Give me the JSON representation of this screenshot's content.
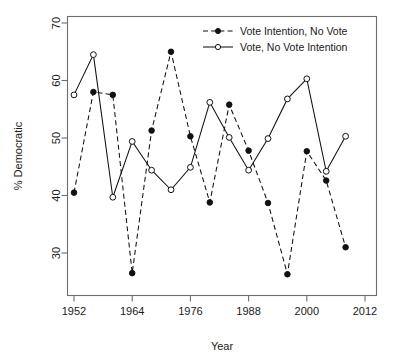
{
  "chart_data": {
    "type": "line",
    "title": "",
    "xlabel": "Year",
    "ylabel": "% Democratic",
    "xlim": [
      1950,
      2013
    ],
    "ylim": [
      25,
      71
    ],
    "xticks": [
      1952,
      1964,
      1976,
      1988,
      2000,
      2012
    ],
    "yticks": [
      30,
      40,
      50,
      60,
      70
    ],
    "grid": false,
    "legend_position": "top-right",
    "x": [
      1952,
      1956,
      1960,
      1964,
      1968,
      1972,
      1976,
      1980,
      1984,
      1988,
      1992,
      1996,
      2000,
      2004,
      2008
    ],
    "series": [
      {
        "name": "Vote Intention, No Vote",
        "marker": "filled-circle",
        "line": "dashed",
        "color": "#111111",
        "values": [
          40.5,
          58.0,
          57.5,
          26.5,
          51.3,
          65.0,
          50.3,
          38.8,
          55.8,
          47.8,
          38.7,
          26.3,
          47.7,
          42.6,
          31.0
        ]
      },
      {
        "name": "Vote, No Vote Intention",
        "marker": "open-circle",
        "line": "solid",
        "color": "#111111",
        "values": [
          57.5,
          64.5,
          39.7,
          49.4,
          44.4,
          41.0,
          44.9,
          56.2,
          50.1,
          44.4,
          49.9,
          56.8,
          60.3,
          44.2,
          50.3
        ]
      }
    ]
  },
  "legend": {
    "entries": [
      {
        "label": "Vote Intention, No Vote"
      },
      {
        "label": "Vote, No Vote Intention"
      }
    ]
  },
  "axes": {
    "x_title": "Year",
    "y_title": "% Democratic",
    "x_tick_labels": [
      "1952",
      "1964",
      "1976",
      "1988",
      "2000",
      "2012"
    ],
    "y_tick_labels": [
      "30",
      "40",
      "50",
      "60",
      "70"
    ]
  }
}
